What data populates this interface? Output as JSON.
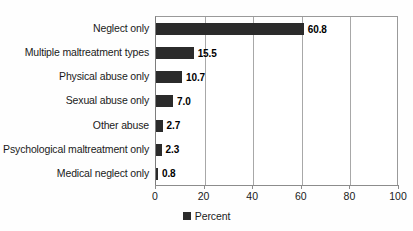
{
  "chart_data": {
    "type": "bar",
    "orientation": "horizontal",
    "title": "",
    "xlabel": "",
    "ylabel": "",
    "xlim": [
      0,
      100
    ],
    "xticks": [
      0,
      20,
      40,
      60,
      80,
      100
    ],
    "grid": true,
    "legend": {
      "position": "bottom-center",
      "entries": [
        {
          "label": "Percent",
          "color": "#2b2b2b"
        }
      ]
    },
    "categories": [
      "Neglect only",
      "Multiple maltreatment types",
      "Physical abuse only",
      "Sexual abuse only",
      "Other abuse",
      "Psychological maltreatment only",
      "Medical neglect only"
    ],
    "values": [
      60.8,
      15.5,
      10.7,
      7.0,
      2.7,
      2.3,
      0.8
    ],
    "value_labels": [
      "60.8",
      "15.5",
      "10.7",
      "7.0",
      "2.7",
      "2.3",
      "0.8"
    ],
    "series": [
      {
        "name": "Percent",
        "color": "#2b2b2b",
        "values": [
          60.8,
          15.5,
          10.7,
          7.0,
          2.7,
          2.3,
          0.8
        ]
      }
    ]
  },
  "colors": {
    "bar": "#2b2b2b",
    "grid": "#a8a8a8",
    "axis": "#8c8c8c",
    "text": "#1a1a1a",
    "background": "#fefefe"
  }
}
